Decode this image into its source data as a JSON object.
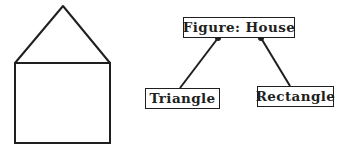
{
  "colors": {
    "ink": "#1f1f1f",
    "paper": "#ffffff"
  },
  "illustration": {
    "shapes": [
      "triangle-roof",
      "rectangle-body"
    ]
  },
  "tree": {
    "root": {
      "label": "Figure: House"
    },
    "children": [
      {
        "label": "Triangle"
      },
      {
        "label": "Rectangle"
      }
    ]
  }
}
